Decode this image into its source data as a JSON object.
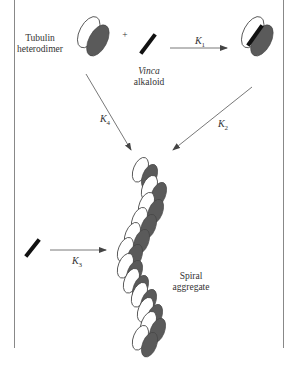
{
  "figure": {
    "labels": {
      "tubulin_line1": "Tubulin",
      "tubulin_line2": "heterodimer",
      "plus": "+",
      "vinca_line1": "Vinca",
      "vinca_line2": "alkaloid",
      "k1": "K",
      "k1_sub": "1",
      "k2": "K",
      "k2_sub": "2",
      "k3": "K",
      "k3_sub": "3",
      "k4": "K",
      "k4_sub": "4",
      "spiral_line1": "Spiral",
      "spiral_line2": "aggregate"
    },
    "colors": {
      "dark_subunit": "#5a5a5a",
      "light_subunit": "#ffffff",
      "outline": "#444444",
      "drug": "#111111",
      "frame": "#888888",
      "arrow": "#555555"
    }
  }
}
